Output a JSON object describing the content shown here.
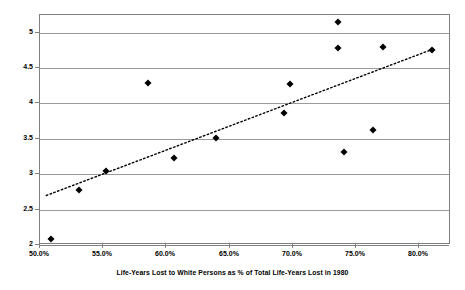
{
  "chart_data": {
    "type": "scatter",
    "title": "",
    "xlabel": "Life-Years Lost to White Persons as % of Total Life-Years Lost in 1980",
    "ylabel": "Log of Public R&D Expenditure in 1982",
    "xlim": [
      50.0,
      82.5
    ],
    "ylim": [
      2,
      5.25
    ],
    "grid": true,
    "legend": "none",
    "x_ticks": [
      "50.0%",
      "55.0%",
      "60.0%",
      "65.0%",
      "70.0%",
      "75.0%",
      "80.0%"
    ],
    "x_tick_values": [
      50.0,
      55.0,
      60.0,
      65.0,
      70.0,
      75.0,
      80.0
    ],
    "y_ticks": [
      "2",
      "2.5",
      "3",
      "3.5",
      "4",
      "4.5",
      "5"
    ],
    "y_tick_values": [
      2,
      2.5,
      3,
      3.5,
      4,
      4.5,
      5
    ],
    "points": [
      {
        "x": 50.9,
        "y": 2.08
      },
      {
        "x": 53.1,
        "y": 2.78
      },
      {
        "x": 55.2,
        "y": 3.05
      },
      {
        "x": 58.5,
        "y": 4.29
      },
      {
        "x": 60.6,
        "y": 3.23
      },
      {
        "x": 63.9,
        "y": 3.51
      },
      {
        "x": 69.3,
        "y": 3.86
      },
      {
        "x": 69.8,
        "y": 4.27
      },
      {
        "x": 73.6,
        "y": 5.15
      },
      {
        "x": 73.6,
        "y": 4.79
      },
      {
        "x": 74.0,
        "y": 3.32
      },
      {
        "x": 76.3,
        "y": 3.63
      },
      {
        "x": 77.1,
        "y": 4.8
      },
      {
        "x": 81.0,
        "y": 4.76
      }
    ],
    "trendline": {
      "style": "dotted",
      "x_start": 50.5,
      "y_start": 2.7,
      "x_end": 81.1,
      "y_end": 4.77
    },
    "colors": {
      "marker": "#000000",
      "grid": "#9a9a9a",
      "frame": "#808080",
      "background": "#ffffff",
      "trendline": "#000000"
    }
  }
}
